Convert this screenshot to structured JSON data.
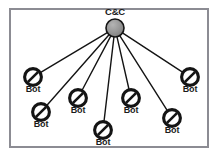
{
  "figure": {
    "frame_color": "#8c8c93",
    "background_color": "#ffffff",
    "line_color": "#141414",
    "cc_fill_color": "#8f8f8f",
    "bot_fill_color": "#ffffff",
    "bot_stroke_color": "#141414"
  },
  "cc_node": {
    "label": "C&C",
    "icon": "server-circle-icon",
    "x": 115,
    "y": 28,
    "r": 9
  },
  "bot_nodes": [
    {
      "label": "Bot",
      "icon": "bot-slashed-circle-icon",
      "x": 33,
      "y": 77,
      "r": 10,
      "label_x": 33,
      "label_y": 89
    },
    {
      "label": "Bot",
      "icon": "bot-slashed-circle-icon",
      "x": 41,
      "y": 112,
      "r": 10,
      "label_x": 41,
      "label_y": 124
    },
    {
      "label": "Bot",
      "icon": "bot-slashed-circle-icon",
      "x": 78,
      "y": 98,
      "r": 10,
      "label_x": 78,
      "label_y": 110
    },
    {
      "label": "Bot",
      "icon": "bot-slashed-circle-icon",
      "x": 103,
      "y": 130,
      "r": 10,
      "label_x": 103,
      "label_y": 142
    },
    {
      "label": "Bot",
      "icon": "bot-slashed-circle-icon",
      "x": 131,
      "y": 98,
      "r": 10,
      "label_x": 131,
      "label_y": 110
    },
    {
      "label": "Bot",
      "icon": "bot-slashed-circle-icon",
      "x": 172,
      "y": 118,
      "r": 10,
      "label_x": 172,
      "label_y": 130
    },
    {
      "label": "Bot",
      "icon": "bot-slashed-circle-icon",
      "x": 190,
      "y": 77,
      "r": 10,
      "label_x": 190,
      "label_y": 89
    }
  ],
  "edges": [
    {
      "from": "cc",
      "to": 0
    },
    {
      "from": "cc",
      "to": 1
    },
    {
      "from": "cc",
      "to": 2
    },
    {
      "from": "cc",
      "to": 3
    },
    {
      "from": "cc",
      "to": 4
    },
    {
      "from": "cc",
      "to": 5
    },
    {
      "from": "cc",
      "to": 6
    }
  ]
}
